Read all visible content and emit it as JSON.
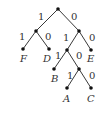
{
  "diagram": {
    "type": "binary code tree",
    "edge_labels": {
      "root_left": "1",
      "root_right": "0",
      "n1_left": "1",
      "n1_right": "0",
      "n2_left": "1",
      "n2_right": "0",
      "n3_left": "1",
      "n3_right": "0",
      "n4_left": "1",
      "n4_right": "0"
    },
    "leaves": {
      "F": "F",
      "D": "D",
      "E": "E",
      "B": "B",
      "A": "A",
      "C": "C"
    }
  }
}
